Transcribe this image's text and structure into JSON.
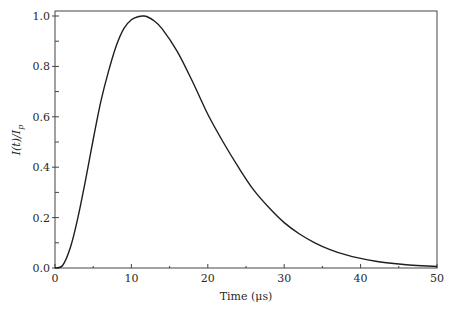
{
  "chart_data": {
    "type": "line",
    "title": "",
    "xlabel": "Time (μs)",
    "ylabel": "I(t)/I_p",
    "xlim": [
      0,
      50
    ],
    "ylim": [
      0,
      1.0
    ],
    "grid": false,
    "legend": null,
    "x_ticks": [
      "0",
      "10",
      "20",
      "30",
      "40",
      "50"
    ],
    "y_ticks": [
      "0.0",
      "0.2",
      "0.4",
      "0.6",
      "0.8",
      "1.0"
    ],
    "series": [
      {
        "name": "normalized current",
        "x": [
          0,
          1,
          2,
          3,
          4,
          5,
          6,
          7,
          8,
          9,
          10,
          11,
          11.5,
          12,
          13,
          14,
          16,
          18,
          20,
          22,
          24,
          26,
          28,
          30,
          32,
          34,
          36,
          38,
          40,
          42,
          44,
          46,
          48,
          50
        ],
        "y": [
          0,
          0.01,
          0.08,
          0.2,
          0.35,
          0.51,
          0.66,
          0.78,
          0.88,
          0.95,
          0.985,
          0.998,
          1.0,
          0.998,
          0.98,
          0.95,
          0.86,
          0.74,
          0.61,
          0.5,
          0.4,
          0.31,
          0.24,
          0.18,
          0.135,
          0.1,
          0.073,
          0.053,
          0.038,
          0.027,
          0.019,
          0.013,
          0.009,
          0.006
        ]
      }
    ]
  }
}
